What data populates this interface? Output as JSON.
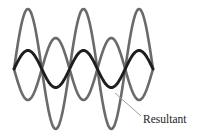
{
  "diagram": {
    "title": "",
    "labels": {
      "resultant": "Resultant"
    },
    "colors": {
      "component_wave": "#6a6a6a",
      "resultant_wave": "#1e1e1e",
      "pointer_line": "#a0a0a0",
      "background": "#ffffff"
    },
    "geometry": {
      "x_start": 14,
      "x_end": 153,
      "half_periods": 5,
      "midline_y": 69,
      "wave_large_amplitude": 60,
      "wave_small_amplitude": 31,
      "resultant_amplitude": 18.5,
      "stroke_width": 2.6
    },
    "pointer": {
      "from": [
        115,
        93
      ],
      "to": [
        141,
        116
      ]
    }
  }
}
